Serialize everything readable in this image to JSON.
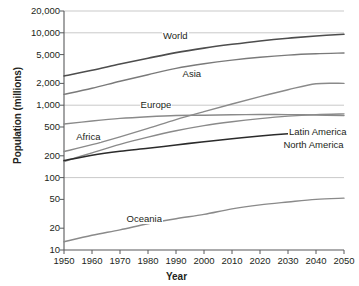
{
  "chart_data": {
    "type": "line",
    "title": "",
    "xlabel": "Year",
    "ylabel": "Population (millions)",
    "yscale": "log",
    "ylim": [
      10,
      20000
    ],
    "xlim": [
      1950,
      2050
    ],
    "grid": true,
    "gridlines_at": [
      20000,
      10000,
      1000,
      100
    ],
    "legend_position": "inline-labels",
    "ytick_labels": [
      "20,000",
      "10,000",
      "5,000",
      "2,000",
      "1,000",
      "500",
      "200",
      "100",
      "50",
      "20",
      "10"
    ],
    "ytick_values": [
      20000,
      10000,
      5000,
      2000,
      1000,
      500,
      200,
      100,
      50,
      20,
      10
    ],
    "xtick_labels": [
      "1950",
      "1960",
      "1970",
      "1980",
      "1990",
      "2000",
      "2010",
      "2020",
      "2030",
      "2040",
      "2050"
    ],
    "xtick_values": [
      1950,
      1960,
      1970,
      1980,
      1990,
      2000,
      2010,
      2020,
      2030,
      2040,
      2050
    ],
    "x": [
      1950,
      1960,
      1970,
      1980,
      1990,
      2000,
      2010,
      2020,
      2030,
      2040,
      2050
    ],
    "series": [
      {
        "name": "World",
        "color": "#4d4d4d",
        "width": 1.6,
        "values": [
          2536,
          3035,
          3700,
          4458,
          5327,
          6145,
          6930,
          7717,
          8425,
          9039,
          9551
        ],
        "label_x": 1985,
        "label_y": 9000
      },
      {
        "name": "Asia",
        "color": "#7a7a7a",
        "width": 1.4,
        "values": [
          1411,
          1714,
          2142,
          2637,
          3221,
          3730,
          4194,
          4601,
          4923,
          5136,
          5257
        ],
        "label_x": 1992,
        "label_y": 2700
      },
      {
        "name": "Africa",
        "color": "#8a8a8a",
        "width": 1.4,
        "values": [
          229,
          285,
          366,
          478,
          632,
          814,
          1039,
          1312,
          1634,
          1979,
          2000
        ],
        "label_x": 1954,
        "label_y": 360
      },
      {
        "name": "Europe",
        "color": "#8a8a8a",
        "width": 1.4,
        "values": [
          549,
          605,
          657,
          694,
          721,
          727,
          738,
          744,
          741,
          732,
          719
        ],
        "label_x": 1977,
        "label_y": 1000
      },
      {
        "name": "Latin America",
        "color": "#8a8a8a",
        "width": 1.4,
        "values": [
          167,
          220,
          288,
          362,
          443,
          522,
          590,
          652,
          706,
          742,
          760
        ],
        "label_x": 2030,
        "label_y": 430
      },
      {
        "name": "North America",
        "color": "#2b2b2b",
        "width": 1.6,
        "values": [
          172,
          204,
          231,
          254,
          282,
          313,
          344,
          376,
          404,
          427,
          446
        ],
        "label_x": 2028,
        "label_y": 280
      },
      {
        "name": "Oceania",
        "color": "#8a8a8a",
        "width": 1.4,
        "values": [
          13,
          16,
          19,
          23,
          27,
          31,
          37,
          42,
          46,
          50,
          52
        ],
        "label_x": 1972,
        "label_y": 27
      }
    ]
  }
}
